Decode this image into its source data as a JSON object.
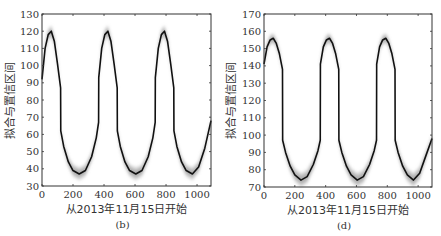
{
  "chart_data": [
    {
      "type": "line",
      "panel_label": "(b)",
      "title": "",
      "xlabel": "从2013年11月15日开始",
      "ylabel": "拟合与置信区间",
      "xlim": [
        0,
        1090
      ],
      "ylim": [
        30,
        130
      ],
      "xticks": [
        0,
        200,
        400,
        600,
        800,
        1000
      ],
      "yticks": [
        30,
        40,
        50,
        60,
        70,
        80,
        90,
        100,
        110,
        120,
        130
      ],
      "grid": false,
      "series": [
        {
          "name": "fit",
          "color": "#111111",
          "x": [
            0,
            20,
            40,
            60,
            80,
            100,
            120,
            121,
            140,
            170,
            200,
            240,
            280,
            320,
            350,
            365,
            366,
            385,
            405,
            425,
            445,
            465,
            485,
            486,
            505,
            535,
            565,
            605,
            645,
            685,
            715,
            730,
            731,
            750,
            770,
            790,
            810,
            830,
            850,
            851,
            870,
            900,
            930,
            970,
            1010,
            1050,
            1090
          ],
          "y": [
            92,
            110,
            118,
            120,
            114,
            101,
            87,
            62,
            53,
            44,
            39,
            37,
            39,
            47,
            58,
            67,
            93,
            110,
            118,
            120,
            114,
            101,
            87,
            62,
            53,
            44,
            39,
            37,
            39,
            47,
            58,
            67,
            93,
            110,
            118,
            120,
            114,
            101,
            87,
            62,
            53,
            44,
            39,
            37,
            41,
            52,
            68
          ]
        }
      ],
      "confidence_band": {
        "color": "#9a9a9a",
        "half_width_peak": 5,
        "half_width_trough": 3
      }
    },
    {
      "type": "line",
      "panel_label": "(d)",
      "title": "",
      "xlabel": "从2013年11月15日开始",
      "ylabel": "拟合与置信区间",
      "xlim": [
        0,
        1090
      ],
      "ylim": [
        70,
        170
      ],
      "xticks": [
        0,
        200,
        400,
        600,
        800,
        1000
      ],
      "yticks": [
        70,
        80,
        90,
        100,
        110,
        120,
        130,
        140,
        150,
        160,
        170
      ],
      "grid": false,
      "series": [
        {
          "name": "fit",
          "color": "#111111",
          "x": [
            0,
            20,
            40,
            60,
            80,
            100,
            120,
            121,
            140,
            170,
            200,
            240,
            280,
            320,
            350,
            365,
            366,
            385,
            405,
            425,
            445,
            465,
            485,
            486,
            505,
            535,
            565,
            605,
            645,
            685,
            715,
            730,
            731,
            750,
            770,
            790,
            810,
            830,
            850,
            851,
            870,
            900,
            930,
            970,
            1010,
            1050,
            1090
          ],
          "y": [
            141,
            151,
            155,
            156,
            153,
            147,
            138,
            97,
            90,
            82,
            77,
            74,
            76,
            83,
            91,
            97,
            141,
            151,
            155,
            156,
            153,
            147,
            138,
            97,
            90,
            82,
            77,
            74,
            76,
            83,
            91,
            97,
            141,
            151,
            155,
            156,
            153,
            147,
            138,
            97,
            90,
            82,
            77,
            74,
            78,
            88,
            98
          ]
        }
      ],
      "confidence_band": {
        "color": "#9a9a9a",
        "half_width_peak": 5,
        "half_width_trough": 3
      }
    }
  ]
}
